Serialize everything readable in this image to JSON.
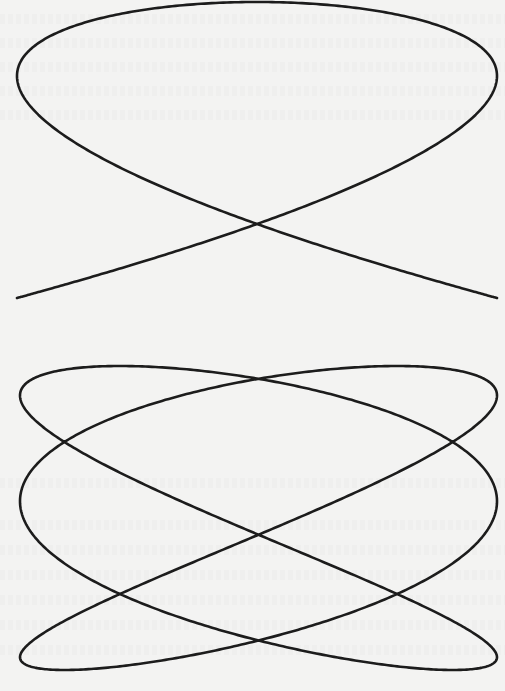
{
  "page": {
    "width": 505,
    "height": 691,
    "background": "#f3f3f2"
  },
  "figures": [
    {
      "id": "top",
      "description": "Lissajous figure, 3:2 frequency ratio, symmetric phase",
      "box": {
        "x": 17,
        "y": 2,
        "width": 480,
        "height": 296
      },
      "freq_x": 3,
      "freq_y": 2,
      "phase_x": 0,
      "y_mode": "neg_cos",
      "stroke": "#1c1c1c",
      "stroke_width": 2.6
    },
    {
      "id": "bottom",
      "description": "Lissajous figure, 3:2 frequency ratio, shifted phase",
      "box": {
        "x": 20,
        "y": 366,
        "width": 477,
        "height": 304
      },
      "freq_x": 3,
      "freq_y": 2,
      "phase_x": 0.62,
      "y_mode": "neg_cos",
      "stroke": "#1c1c1c",
      "stroke_width": 2.6
    }
  ]
}
